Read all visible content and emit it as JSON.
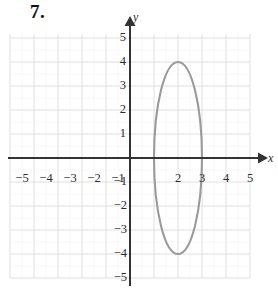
{
  "problem": {
    "number_label": "7."
  },
  "axes": {
    "x_axis_label": "x",
    "y_axis_label": "y",
    "x_tick_labels": [
      "−5",
      "−4",
      "−3",
      "−2",
      "−1",
      "2",
      "3",
      "4",
      "5"
    ],
    "y_tick_labels": [
      "5",
      "4",
      "3",
      "2",
      "1",
      "−1",
      "−2",
      "−3",
      "−4",
      "−5"
    ]
  },
  "colors": {
    "axis": "#333333",
    "curve": "#9a9a9a",
    "grid_major": "#d8d8d8",
    "grid_minor": "#e8e8e8",
    "text": "#2b2b2b",
    "background": "#ffffff"
  },
  "chart_data": {
    "type": "line",
    "title": "",
    "xlabel": "x",
    "ylabel": "y",
    "xlim": [
      -5.5,
      5.5
    ],
    "ylim": [
      -5.5,
      5.5
    ],
    "xticks": [
      -5,
      -4,
      -3,
      -2,
      -1,
      2,
      3,
      4,
      5
    ],
    "yticks": [
      5,
      4,
      3,
      2,
      1,
      -1,
      -2,
      -3,
      -4,
      -5
    ],
    "grid": true,
    "legend": "none",
    "curves": [
      {
        "name": "ellipse",
        "shape": "ellipse",
        "center": [
          2,
          0
        ],
        "semi_axis_x": 1,
        "semi_axis_y": 4,
        "vertices": [
          [
            2,
            4
          ],
          [
            2,
            -4
          ]
        ],
        "co_vertices": [
          [
            1,
            0
          ],
          [
            3,
            0
          ]
        ],
        "color": "#9a9a9a"
      }
    ]
  }
}
